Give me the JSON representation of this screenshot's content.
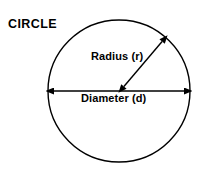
{
  "figure": {
    "title": "CIRCLE",
    "background_color": "#ffffff",
    "stroke_color": "#000000",
    "text_color": "#000000",
    "labels": {
      "radius": "Radius (r)",
      "diameter": "Diameter (d)"
    },
    "shapes": {
      "circle": {
        "name": "circle-outline",
        "center_x": 119,
        "center_y": 91,
        "radius": 71,
        "stroke_width": 1.4,
        "fill": "none"
      },
      "diameter_arrow": {
        "name": "diameter-double-arrow",
        "x1": 50,
        "y1": 91,
        "x2": 188,
        "y2": 91,
        "stroke_width": 1.4,
        "arrowheads": "both"
      },
      "radius_arrow": {
        "name": "radius-double-arrow",
        "x1": 120,
        "y1": 91,
        "x2": 166,
        "y2": 37,
        "stroke_width": 1.4,
        "arrowheads": "both"
      }
    }
  }
}
